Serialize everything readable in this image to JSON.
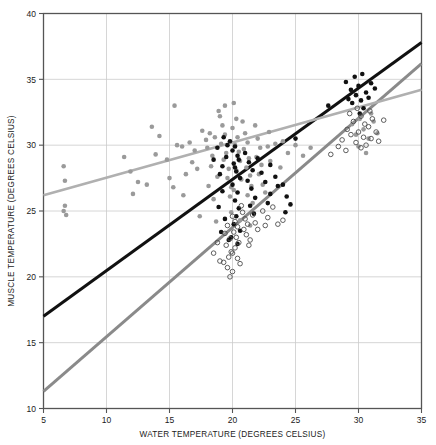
{
  "chart_data": {
    "type": "scatter",
    "title": "",
    "xlabel": "WATER TEMPERATURE (DEGREES CELSIUS)",
    "ylabel": "MUSCLE TEMPERATURE (DEGREES CELSIUS)",
    "xlim": [
      5,
      35
    ],
    "ylim": [
      10,
      40
    ],
    "xticks": [
      5,
      10,
      15,
      20,
      25,
      30,
      35
    ],
    "yticks": [
      10,
      15,
      20,
      25,
      30,
      35,
      40
    ],
    "grid": true,
    "legend": "none",
    "colors": {
      "series_gray": "#9a9a9a",
      "series_black": "#111111",
      "series_open": "#4d4d4d",
      "line_black": "#111111",
      "line_midgray": "#8a8a8a",
      "line_lightgray": "#b0b0b0",
      "grid": "#cccccc",
      "frame": "#555555"
    },
    "series": [
      {
        "name": "gray-filled-points",
        "marker": "filled-circle",
        "color": "#9a9a9a",
        "points": [
          [
            6.6,
            28.4
          ],
          [
            6.7,
            27.3
          ],
          [
            6.7,
            25.4
          ],
          [
            6.6,
            25.0
          ],
          [
            6.8,
            24.7
          ],
          [
            13.6,
            31.4
          ],
          [
            14.2,
            30.7
          ],
          [
            13.9,
            29.3
          ],
          [
            11.9,
            28.0
          ],
          [
            12.5,
            27.2
          ],
          [
            15.4,
            33.0
          ],
          [
            15.6,
            30.0
          ],
          [
            16.0,
            29.9
          ],
          [
            16.6,
            30.2
          ],
          [
            17.0,
            29.6
          ],
          [
            16.8,
            28.7
          ],
          [
            16.3,
            27.8
          ],
          [
            17.2,
            28.2
          ],
          [
            15.3,
            26.8
          ],
          [
            16.1,
            26.2
          ],
          [
            17.6,
            31.1
          ],
          [
            17.9,
            30.4
          ],
          [
            18.2,
            30.9
          ],
          [
            18.0,
            29.8
          ],
          [
            18.4,
            29.2
          ],
          [
            18.6,
            30.6
          ],
          [
            18.3,
            28.4
          ],
          [
            18.8,
            27.6
          ],
          [
            18.1,
            26.9
          ],
          [
            18.5,
            25.9
          ],
          [
            19.0,
            32.2
          ],
          [
            19.2,
            31.5
          ],
          [
            19.4,
            30.8
          ],
          [
            19.1,
            30.1
          ],
          [
            19.5,
            29.4
          ],
          [
            19.3,
            28.9
          ],
          [
            19.7,
            28.2
          ],
          [
            19.6,
            27.5
          ],
          [
            19.9,
            26.8
          ],
          [
            19.8,
            26.1
          ],
          [
            20.1,
            33.2
          ],
          [
            20.3,
            32.0
          ],
          [
            20.0,
            31.3
          ],
          [
            20.4,
            30.6
          ],
          [
            20.2,
            30.0
          ],
          [
            20.5,
            29.5
          ],
          [
            20.6,
            28.8
          ],
          [
            20.3,
            28.1
          ],
          [
            20.7,
            27.4
          ],
          [
            20.1,
            26.6
          ],
          [
            20.8,
            31.8
          ],
          [
            21.0,
            30.9
          ],
          [
            21.2,
            30.2
          ],
          [
            20.9,
            29.7
          ],
          [
            21.3,
            29.0
          ],
          [
            21.1,
            28.3
          ],
          [
            21.4,
            27.7
          ],
          [
            21.5,
            26.9
          ],
          [
            21.2,
            26.2
          ],
          [
            21.6,
            25.6
          ],
          [
            21.8,
            31.5
          ],
          [
            22.0,
            30.5
          ],
          [
            22.2,
            29.8
          ],
          [
            21.9,
            29.1
          ],
          [
            22.3,
            28.5
          ],
          [
            22.1,
            27.8
          ],
          [
            22.4,
            27.0
          ],
          [
            22.6,
            26.4
          ],
          [
            22.8,
            29.9
          ],
          [
            23.0,
            28.8
          ],
          [
            17.4,
            24.6
          ],
          [
            18.7,
            24.2
          ],
          [
            19.9,
            24.9
          ],
          [
            20.6,
            24.3
          ],
          [
            21.4,
            23.9
          ],
          [
            14.8,
            28.9
          ],
          [
            15.0,
            27.5
          ],
          [
            13.2,
            27.0
          ],
          [
            12.1,
            26.3
          ],
          [
            11.4,
            29.1
          ],
          [
            24.0,
            30.3
          ],
          [
            24.4,
            29.4
          ],
          [
            25.0,
            30.0
          ],
          [
            25.6,
            29.2
          ],
          [
            26.2,
            29.8
          ],
          [
            29.5,
            31.6
          ],
          [
            29.8,
            30.8
          ],
          [
            30.1,
            32.0
          ],
          [
            30.4,
            31.2
          ],
          [
            30.8,
            30.5
          ],
          [
            31.2,
            31.8
          ],
          [
            31.5,
            30.9
          ],
          [
            30.0,
            29.9
          ],
          [
            30.6,
            29.4
          ],
          [
            31.0,
            32.4
          ],
          [
            22.9,
            31.0
          ],
          [
            23.4,
            30.1
          ],
          [
            23.8,
            28.3
          ],
          [
            19.4,
            33.0
          ],
          [
            18.9,
            32.6
          ]
        ]
      },
      {
        "name": "black-filled-points",
        "marker": "filled-circle",
        "color": "#111111",
        "points": [
          [
            19.3,
            30.6
          ],
          [
            19.6,
            30.0
          ],
          [
            19.8,
            30.3
          ],
          [
            20.0,
            29.6
          ],
          [
            20.2,
            29.9
          ],
          [
            20.4,
            29.2
          ],
          [
            20.1,
            28.6
          ],
          [
            20.5,
            28.9
          ],
          [
            20.3,
            28.0
          ],
          [
            20.6,
            27.5
          ],
          [
            20.0,
            27.0
          ],
          [
            20.4,
            26.4
          ],
          [
            20.2,
            25.8
          ],
          [
            20.5,
            25.2
          ],
          [
            20.3,
            24.6
          ],
          [
            20.1,
            24.0
          ],
          [
            20.6,
            23.5
          ],
          [
            19.9,
            23.0
          ],
          [
            20.4,
            22.5
          ],
          [
            20.2,
            28.3
          ],
          [
            21.0,
            29.4
          ],
          [
            21.3,
            28.7
          ],
          [
            21.6,
            28.1
          ],
          [
            21.2,
            27.3
          ],
          [
            21.5,
            26.7
          ],
          [
            21.8,
            26.0
          ],
          [
            21.4,
            25.4
          ],
          [
            21.7,
            24.8
          ],
          [
            22.0,
            29.0
          ],
          [
            22.3,
            27.9
          ],
          [
            22.6,
            27.2
          ],
          [
            23.0,
            28.5
          ],
          [
            23.4,
            27.6
          ],
          [
            23.0,
            26.3
          ],
          [
            22.8,
            25.6
          ],
          [
            23.6,
            26.9
          ],
          [
            24.0,
            27.0
          ],
          [
            24.3,
            26.1
          ],
          [
            24.6,
            25.5
          ],
          [
            24.2,
            24.9
          ],
          [
            18.8,
            29.8
          ],
          [
            18.5,
            28.9
          ],
          [
            19.0,
            27.8
          ],
          [
            19.2,
            26.5
          ],
          [
            18.9,
            25.3
          ],
          [
            19.4,
            24.4
          ],
          [
            19.1,
            23.4
          ],
          [
            19.7,
            22.8
          ],
          [
            19.5,
            29.1
          ],
          [
            19.2,
            28.4
          ],
          [
            29.0,
            34.8
          ],
          [
            29.4,
            34.2
          ],
          [
            29.7,
            35.2
          ],
          [
            30.0,
            34.5
          ],
          [
            30.3,
            35.4
          ],
          [
            29.8,
            33.8
          ],
          [
            30.2,
            33.4
          ],
          [
            30.6,
            34.0
          ],
          [
            31.0,
            34.7
          ],
          [
            29.5,
            33.2
          ],
          [
            30.4,
            32.8
          ],
          [
            30.8,
            33.6
          ],
          [
            31.3,
            34.3
          ],
          [
            29.2,
            33.5
          ],
          [
            30.1,
            32.4
          ],
          [
            27.6,
            33.0
          ],
          [
            25.0,
            30.5
          ]
        ]
      },
      {
        "name": "open-circle-points",
        "marker": "open-circle",
        "color": "#4d4d4d",
        "points": [
          [
            20.0,
            24.6
          ],
          [
            20.2,
            24.2
          ],
          [
            20.4,
            23.8
          ],
          [
            20.1,
            23.4
          ],
          [
            20.3,
            23.0
          ],
          [
            20.5,
            22.6
          ],
          [
            20.2,
            22.2
          ],
          [
            20.0,
            21.8
          ],
          [
            20.4,
            21.4
          ],
          [
            20.6,
            21.0
          ],
          [
            20.8,
            24.9
          ],
          [
            21.0,
            24.4
          ],
          [
            21.2,
            24.0
          ],
          [
            20.9,
            23.6
          ],
          [
            21.1,
            23.2
          ],
          [
            21.4,
            22.8
          ],
          [
            21.3,
            22.4
          ],
          [
            21.6,
            24.7
          ],
          [
            21.8,
            24.1
          ],
          [
            22.0,
            23.6
          ],
          [
            19.6,
            23.9
          ],
          [
            19.4,
            23.3
          ],
          [
            19.8,
            22.9
          ],
          [
            19.5,
            22.4
          ],
          [
            19.9,
            21.9
          ],
          [
            19.7,
            21.5
          ],
          [
            19.3,
            21.1
          ],
          [
            19.6,
            20.7
          ],
          [
            20.0,
            20.4
          ],
          [
            19.8,
            20.0
          ],
          [
            22.4,
            25.0
          ],
          [
            22.8,
            24.5
          ],
          [
            23.2,
            25.3
          ],
          [
            22.6,
            23.9
          ],
          [
            23.6,
            24.0
          ],
          [
            24.0,
            24.3
          ],
          [
            18.8,
            22.6
          ],
          [
            18.5,
            21.8
          ],
          [
            19.0,
            21.2
          ],
          [
            20.7,
            25.4
          ],
          [
            29.3,
            32.4
          ],
          [
            29.6,
            31.8
          ],
          [
            29.9,
            32.8
          ],
          [
            30.2,
            32.2
          ],
          [
            30.5,
            31.6
          ],
          [
            30.0,
            31.0
          ],
          [
            30.4,
            30.6
          ],
          [
            30.8,
            31.4
          ],
          [
            31.1,
            32.0
          ],
          [
            29.4,
            30.8
          ],
          [
            29.8,
            30.2
          ],
          [
            30.2,
            29.8
          ],
          [
            30.6,
            30.0
          ],
          [
            31.0,
            30.5
          ],
          [
            29.1,
            31.2
          ],
          [
            28.7,
            30.4
          ],
          [
            28.4,
            29.9
          ],
          [
            31.4,
            31.0
          ],
          [
            29.0,
            29.6
          ],
          [
            30.9,
            32.6
          ],
          [
            27.8,
            29.3
          ],
          [
            32.0,
            31.9
          ],
          [
            31.6,
            30.3
          ]
        ]
      }
    ],
    "fit_lines": [
      {
        "name": "black-regression-line",
        "color": "#111111",
        "width": 3.0,
        "x0": 5,
        "y0": 17.0,
        "x1": 35,
        "y1": 37.8
      },
      {
        "name": "midgray-regression-line",
        "color": "#8a8a8a",
        "width": 3.0,
        "x0": 5,
        "y0": 11.3,
        "x1": 35,
        "y1": 36.2
      },
      {
        "name": "lightgray-regression-line",
        "color": "#b0b0b0",
        "width": 2.6,
        "x0": 5,
        "y0": 26.2,
        "x1": 35,
        "y1": 34.2
      }
    ]
  }
}
